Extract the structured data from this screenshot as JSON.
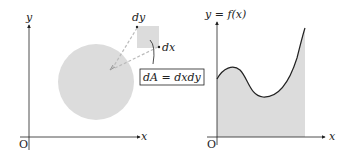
{
  "colors": {
    "fill": "#dcdcdc",
    "stroke": "#222222",
    "dash": "#bbbbbb"
  },
  "left_panel": {
    "y_axis_label": "y",
    "x_axis_label": "x",
    "origin_label": "O",
    "dy_label": "dy",
    "dx_label": "dx",
    "area_formula": "dA = dxdy"
  },
  "right_panel": {
    "y_axis_label": "y = f(x)",
    "x_axis_label": "x",
    "origin_label": "O"
  }
}
